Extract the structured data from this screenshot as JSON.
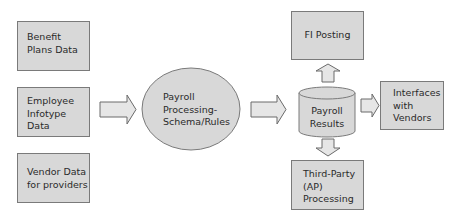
{
  "inputs": [
    {
      "lines": [
        "Benefit",
        "Plans Data"
      ]
    },
    {
      "lines": [
        "Employee",
        "Infotype",
        "Data"
      ]
    },
    {
      "lines": [
        "Vendor Data",
        "for providers"
      ]
    }
  ],
  "process": {
    "lines": [
      "Payroll",
      "Processing-",
      "Schema/Rules"
    ]
  },
  "results": {
    "lines": [
      "Payroll",
      "Results"
    ]
  },
  "outputs": {
    "fi_posting": {
      "lines": [
        "FI Posting"
      ]
    },
    "interfaces": {
      "lines": [
        "Interfaces",
        "with",
        "Vendors"
      ]
    },
    "third_party": {
      "lines": [
        "Third-Party",
        "(AP)",
        "Processing"
      ]
    }
  },
  "colors": {
    "fill": "#d8d8d8",
    "border": "#7a7a7a",
    "arrow_fill": "#e6e6e6",
    "text": "#2a2a2a"
  }
}
